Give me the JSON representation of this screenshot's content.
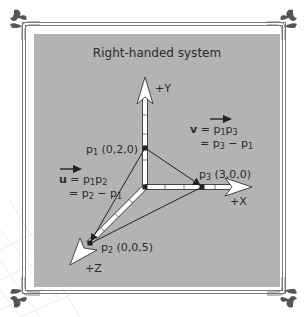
{
  "diagram": {
    "title": "Right-handed system",
    "axes": {
      "y_label": "+Y",
      "x_label": "+X",
      "z_label": "+Z"
    },
    "points": {
      "p1": {
        "name": "p",
        "subscript": "1",
        "coords": "(0,2,0)"
      },
      "p2": {
        "name": "p",
        "subscript": "2",
        "coords": "(0,0,5)"
      },
      "p3": {
        "name": "p",
        "subscript": "3",
        "coords": "(3,0,0)"
      }
    },
    "vector_u": {
      "symbol": "u",
      "eq1_lhs": " = ",
      "eq1_a": "p",
      "eq1_a_sub": "1",
      "eq1_b": "p",
      "eq1_b_sub": "2",
      "eq2_prefix": "= ",
      "eq2_a": "p",
      "eq2_a_sub": "2",
      "eq2_minus": " − ",
      "eq2_b": "p",
      "eq2_b_sub": "1"
    },
    "vector_v": {
      "symbol": "v",
      "eq1_lhs": " = ",
      "eq1_a": "p",
      "eq1_a_sub": "1",
      "eq1_b": "p",
      "eq1_b_sub": "3",
      "eq2_prefix": "= ",
      "eq2_a": "p",
      "eq2_a_sub": "3",
      "eq2_minus": " − ",
      "eq2_b": "p",
      "eq2_b_sub": "1"
    },
    "colors": {
      "panel": "#b3b3b3",
      "frame": "#7a7a7a",
      "axis_fill": "#ffffff",
      "axis_stroke": "#222222",
      "text": "#2b2b2b",
      "ornament": "#555555"
    }
  }
}
